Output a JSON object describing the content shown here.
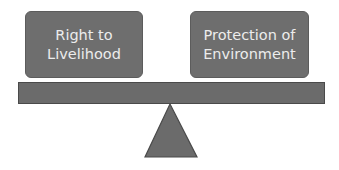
{
  "diagram": {
    "type": "balance-scale",
    "left_item": {
      "label": "Right to Livelihood",
      "lines": [
        "Right to",
        "Livelihood"
      ]
    },
    "right_item": {
      "label": "Protection of Environment",
      "lines": [
        "Protection of",
        "Environment"
      ]
    },
    "colors": {
      "box_fill": "#6e6e6e",
      "box_text": "#ececec",
      "beam_fill": "#6b6b6b",
      "fulcrum_fill": "#6b6b6b",
      "outline": "#4a4a4a",
      "background": "#ffffff"
    }
  }
}
